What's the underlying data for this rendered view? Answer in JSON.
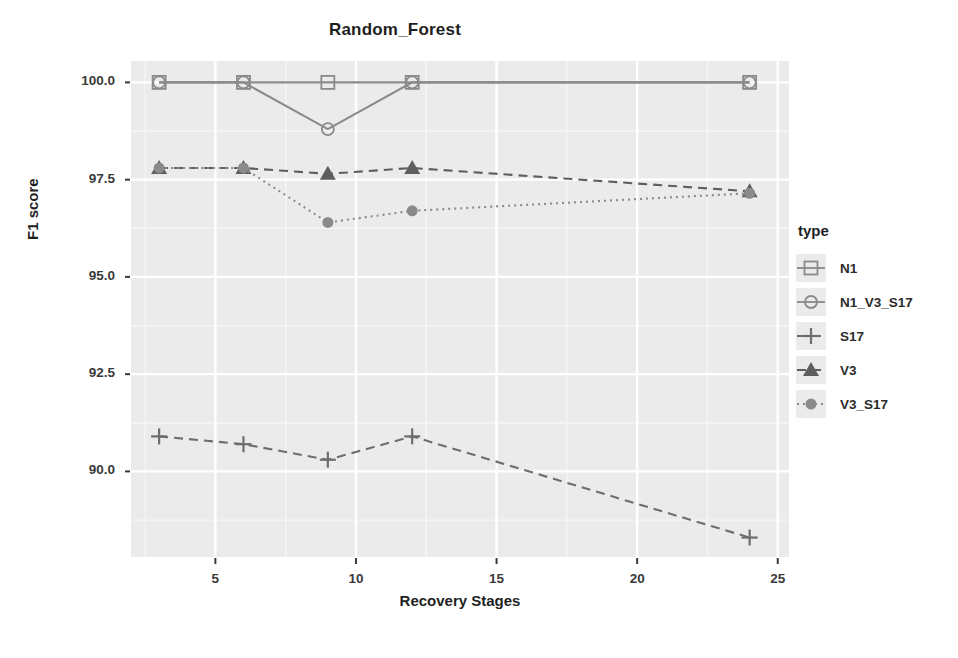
{
  "chart_data": {
    "type": "line",
    "title": "Random_Forest",
    "xlabel": "Recovery Stages",
    "ylabel": "F1 score",
    "x": [
      3,
      6,
      9,
      12,
      24
    ],
    "xlim": [
      2.0,
      25.4
    ],
    "ylim": [
      87.8,
      100.55
    ],
    "xticks": [
      5,
      10,
      15,
      20,
      25
    ],
    "yticks": [
      90.0,
      92.5,
      95.0,
      97.5,
      100.0
    ],
    "xtick_labels": [
      "5",
      "10",
      "15",
      "20",
      "25"
    ],
    "ytick_labels": [
      "90.0",
      "92.5",
      "95.0",
      "97.5",
      "100.0"
    ],
    "grid": true,
    "panel_background": "#ebebeb",
    "grid_major_color": "#ffffff",
    "grid_minor_color": "#f5f5f5",
    "legend_position": "right",
    "legend_title": "type",
    "series": [
      {
        "name": "N1",
        "marker": "square-open",
        "linetype": "solid",
        "color": "#8a8a8a",
        "values": [
          100.0,
          100.0,
          100.0,
          100.0,
          100.0
        ]
      },
      {
        "name": "N1_V3_S17",
        "marker": "circle-open",
        "linetype": "solid",
        "color": "#8a8a8a",
        "values": [
          100.0,
          100.0,
          98.8,
          100.0,
          100.0
        ]
      },
      {
        "name": "S17",
        "marker": "plus",
        "linetype": "dashed",
        "color": "#6d6d6d",
        "values": [
          90.9,
          90.7,
          90.3,
          90.9,
          88.3
        ]
      },
      {
        "name": "V3",
        "marker": "triangle-filled",
        "linetype": "dashed",
        "color": "#5e5e5e",
        "values": [
          97.8,
          97.8,
          97.65,
          97.8,
          97.2
        ]
      },
      {
        "name": "V3_S17",
        "marker": "circle-filled",
        "linetype": "dotted",
        "color": "#8a8a8a",
        "values": [
          97.8,
          97.8,
          96.4,
          96.7,
          97.15
        ]
      }
    ]
  },
  "legend": {
    "title": "type",
    "items": [
      {
        "label": "N1",
        "icon": "square-open-marker-icon"
      },
      {
        "label": "N1_V3_S17",
        "icon": "circle-open-marker-icon"
      },
      {
        "label": "S17",
        "icon": "plus-marker-icon"
      },
      {
        "label": "V3",
        "icon": "triangle-filled-marker-icon"
      },
      {
        "label": "V3_S17",
        "icon": "circle-filled-marker-icon"
      }
    ]
  }
}
